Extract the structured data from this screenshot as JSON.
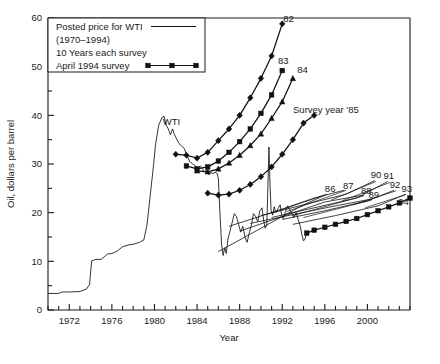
{
  "chart_data": {
    "type": "line",
    "title": "",
    "xlabel": "Year",
    "ylabel": "Oil, dollars per barrel",
    "xlim": [
      1970,
      2004
    ],
    "ylim": [
      0,
      60
    ],
    "xticks_major": [
      1972,
      1976,
      1980,
      1984,
      1988,
      1992,
      1996,
      2000
    ],
    "xtick_labels": [
      "1972",
      "1976",
      "1980",
      "1984",
      "1988",
      "1992",
      "1996",
      "2000"
    ],
    "xtick_minor_step": 1,
    "yticks_major": [
      0,
      10,
      20,
      30,
      40,
      50,
      60
    ],
    "ytick_labels": [
      "0",
      "10",
      "20",
      "30",
      "40",
      "50",
      "60"
    ],
    "ytick_minor": [
      5,
      15,
      25,
      35,
      45,
      55
    ],
    "grid": false,
    "legend_position": "top-left",
    "legend_entries": [
      {
        "label": "Posted price for WTI",
        "sample": "line"
      },
      {
        "label": "(1970–1994)",
        "sample": "none"
      },
      {
        "label": "10 Years each survey",
        "sample": "none"
      },
      {
        "label": "April 1994 survey",
        "sample": "line-square"
      }
    ],
    "annotations": [
      {
        "text": "WTI",
        "x": 1981.6,
        "y": 38.0
      },
      {
        "text": "82",
        "x": 1992.6,
        "y": 59.2
      },
      {
        "text": "83",
        "x": 1992.1,
        "y": 50.6
      },
      {
        "text": "84",
        "x": 1993.9,
        "y": 48.6
      },
      {
        "text": "Survey year '85",
        "x": 1996.1,
        "y": 40.4
      },
      {
        "text": "86",
        "x": 1996.5,
        "y": 24.2
      },
      {
        "text": "87",
        "x": 1998.2,
        "y": 24.9
      },
      {
        "text": "88",
        "x": 1999.9,
        "y": 23.9
      },
      {
        "text": "89",
        "x": 2000.6,
        "y": 23.0
      },
      {
        "text": "90",
        "x": 2000.8,
        "y": 27.2
      },
      {
        "text": "91",
        "x": 2002.0,
        "y": 27.0
      },
      {
        "text": "92",
        "x": 2002.6,
        "y": 25.1
      },
      {
        "text": "93",
        "x": 2003.7,
        "y": 24.3
      },
      {
        "text": "94",
        "x": 2003.4,
        "y": 21.6
      }
    ],
    "series": [
      {
        "name": "Posted price for WTI",
        "marker": "none",
        "kind": "wti",
        "points": [
          [
            1970.0,
            3.4
          ],
          [
            1971.0,
            3.4
          ],
          [
            1971.3,
            3.7
          ],
          [
            1972.0,
            3.7
          ],
          [
            1973.0,
            3.8
          ],
          [
            1973.6,
            4.3
          ],
          [
            1973.9,
            5.2
          ],
          [
            1974.1,
            10.1
          ],
          [
            1974.5,
            10.4
          ],
          [
            1975.0,
            10.4
          ],
          [
            1975.6,
            11.5
          ],
          [
            1976.0,
            11.6
          ],
          [
            1976.5,
            12.1
          ],
          [
            1977.0,
            13.0
          ],
          [
            1977.6,
            13.4
          ],
          [
            1978.0,
            13.5
          ],
          [
            1978.6,
            13.9
          ],
          [
            1979.0,
            14.4
          ],
          [
            1979.3,
            17.5
          ],
          [
            1979.6,
            23.5
          ],
          [
            1979.9,
            29.5
          ],
          [
            1980.1,
            34.0
          ],
          [
            1980.4,
            38.0
          ],
          [
            1980.7,
            39.5
          ],
          [
            1980.9,
            39.8
          ],
          [
            1981.1,
            38.0
          ],
          [
            1981.3,
            37.2
          ],
          [
            1981.5,
            36.0
          ],
          [
            1981.7,
            37.2
          ],
          [
            1981.85,
            36.2
          ],
          [
            1982.0,
            35.5
          ],
          [
            1982.3,
            34.2
          ],
          [
            1982.5,
            33.8
          ],
          [
            1982.8,
            33.2
          ],
          [
            1983.0,
            32.0
          ],
          [
            1983.3,
            30.5
          ],
          [
            1983.6,
            30.0
          ],
          [
            1983.9,
            29.5
          ],
          [
            1984.1,
            29.2
          ],
          [
            1984.3,
            29.6
          ],
          [
            1984.5,
            29.0
          ],
          [
            1984.7,
            28.4
          ],
          [
            1984.9,
            28.8
          ],
          [
            1985.1,
            27.8
          ],
          [
            1985.3,
            28.3
          ],
          [
            1985.5,
            28.0
          ],
          [
            1985.7,
            28.3
          ],
          [
            1985.9,
            28.0
          ],
          [
            1986.0,
            27.0
          ],
          [
            1986.15,
            20.0
          ],
          [
            1986.3,
            13.5
          ],
          [
            1986.45,
            11.2
          ],
          [
            1986.6,
            12.8
          ],
          [
            1986.75,
            11.6
          ],
          [
            1986.9,
            14.6
          ],
          [
            1987.1,
            16.2
          ],
          [
            1987.3,
            18.0
          ],
          [
            1987.5,
            19.8
          ],
          [
            1987.7,
            19.2
          ],
          [
            1987.9,
            17.6
          ],
          [
            1988.1,
            16.0
          ],
          [
            1988.3,
            17.2
          ],
          [
            1988.5,
            15.0
          ],
          [
            1988.7,
            13.9
          ],
          [
            1988.9,
            15.8
          ],
          [
            1989.1,
            17.4
          ],
          [
            1989.3,
            19.8
          ],
          [
            1989.5,
            19.2
          ],
          [
            1989.7,
            18.2
          ],
          [
            1989.9,
            20.4
          ],
          [
            1990.1,
            21.0
          ],
          [
            1990.25,
            18.5
          ],
          [
            1990.4,
            16.8
          ],
          [
            1990.55,
            17.5
          ],
          [
            1990.65,
            25.0
          ],
          [
            1990.75,
            33.5
          ],
          [
            1990.85,
            26.0
          ],
          [
            1990.95,
            20.5
          ],
          [
            1991.1,
            19.5
          ],
          [
            1991.25,
            21.2
          ],
          [
            1991.4,
            20.0
          ],
          [
            1991.6,
            20.8
          ],
          [
            1991.8,
            21.6
          ],
          [
            1991.95,
            19.4
          ],
          [
            1992.1,
            18.8
          ],
          [
            1992.3,
            20.2
          ],
          [
            1992.5,
            21.4
          ],
          [
            1992.7,
            20.6
          ],
          [
            1992.9,
            19.8
          ],
          [
            1993.1,
            19.0
          ],
          [
            1993.3,
            20.0
          ],
          [
            1993.5,
            18.6
          ],
          [
            1993.7,
            17.2
          ],
          [
            1993.85,
            15.4
          ],
          [
            1994.0,
            14.2
          ],
          [
            1994.15,
            14.6
          ],
          [
            1994.3,
            16.0
          ],
          [
            1994.45,
            16.2
          ]
        ]
      },
      {
        "name": "Survey 82",
        "marker": "diamond",
        "kind": "survey",
        "points": [
          [
            1982.0,
            32.0
          ],
          [
            1983.0,
            31.8
          ],
          [
            1984.0,
            31.2
          ],
          [
            1985.0,
            32.4
          ],
          [
            1986.0,
            34.8
          ],
          [
            1987.0,
            37.2
          ],
          [
            1988.0,
            40.0
          ],
          [
            1989.0,
            43.6
          ],
          [
            1990.0,
            47.6
          ],
          [
            1991.0,
            52.2
          ],
          [
            1992.0,
            58.8
          ]
        ]
      },
      {
        "name": "Survey 83",
        "marker": "square",
        "kind": "survey",
        "points": [
          [
            1983.0,
            29.6
          ],
          [
            1984.0,
            29.0
          ],
          [
            1985.0,
            29.4
          ],
          [
            1986.0,
            30.6
          ],
          [
            1987.0,
            32.4
          ],
          [
            1988.0,
            34.6
          ],
          [
            1989.0,
            37.2
          ],
          [
            1990.0,
            40.4
          ],
          [
            1991.0,
            44.2
          ],
          [
            1992.0,
            49.2
          ]
        ]
      },
      {
        "name": "Survey 84",
        "marker": "triangle",
        "kind": "survey",
        "points": [
          [
            1984.0,
            28.6
          ],
          [
            1985.0,
            28.4
          ],
          [
            1986.0,
            29.0
          ],
          [
            1987.0,
            30.2
          ],
          [
            1988.0,
            31.8
          ],
          [
            1989.0,
            33.8
          ],
          [
            1990.0,
            36.2
          ],
          [
            1991.0,
            39.4
          ],
          [
            1992.0,
            42.8
          ],
          [
            1993.0,
            47.6
          ]
        ]
      },
      {
        "name": "Survey year '85",
        "marker": "diamond",
        "kind": "survey",
        "points": [
          [
            1985.0,
            24.0
          ],
          [
            1986.0,
            23.6
          ],
          [
            1987.0,
            23.8
          ],
          [
            1988.0,
            24.6
          ],
          [
            1989.0,
            25.8
          ],
          [
            1990.0,
            27.4
          ],
          [
            1991.0,
            29.4
          ],
          [
            1992.0,
            32.0
          ],
          [
            1993.0,
            35.0
          ],
          [
            1994.0,
            38.4
          ],
          [
            1995.0,
            40.0
          ]
        ]
      },
      {
        "name": "Survey 86",
        "marker": "none",
        "kind": "thin",
        "points": [
          [
            1986.0,
            12.0
          ],
          [
            1990.0,
            16.8
          ],
          [
            1994.0,
            21.6
          ],
          [
            1996.0,
            23.6
          ]
        ]
      },
      {
        "name": "Survey 87",
        "marker": "none",
        "kind": "thin",
        "points": [
          [
            1987.0,
            17.2
          ],
          [
            1991.0,
            20.0
          ],
          [
            1995.0,
            23.0
          ],
          [
            1997.8,
            24.6
          ]
        ]
      },
      {
        "name": "Survey 88",
        "marker": "none",
        "kind": "thin",
        "points": [
          [
            1988.0,
            16.2
          ],
          [
            1992.0,
            19.2
          ],
          [
            1996.0,
            22.2
          ],
          [
            1999.6,
            23.6
          ]
        ]
      },
      {
        "name": "Survey 89",
        "marker": "none",
        "kind": "thin",
        "points": [
          [
            1989.0,
            17.8
          ],
          [
            1993.0,
            19.6
          ],
          [
            1997.0,
            21.4
          ],
          [
            2000.4,
            22.8
          ]
        ]
      },
      {
        "name": "Survey 90",
        "marker": "none",
        "kind": "thin",
        "points": [
          [
            1990.0,
            19.4
          ],
          [
            1994.0,
            21.6
          ],
          [
            1998.0,
            23.8
          ],
          [
            2000.7,
            26.6
          ]
        ]
      },
      {
        "name": "Survey 91",
        "marker": "none",
        "kind": "thin",
        "points": [
          [
            1991.0,
            19.0
          ],
          [
            1995.0,
            21.0
          ],
          [
            1999.0,
            23.0
          ],
          [
            2001.9,
            26.4
          ]
        ]
      },
      {
        "name": "Survey 92",
        "marker": "none",
        "kind": "thin",
        "points": [
          [
            1992.0,
            18.6
          ],
          [
            1996.0,
            20.4
          ],
          [
            2000.0,
            22.4
          ],
          [
            2002.5,
            24.6
          ]
        ]
      },
      {
        "name": "Survey 93",
        "marker": "none",
        "kind": "thin",
        "points": [
          [
            1993.0,
            17.6
          ],
          [
            1997.0,
            19.4
          ],
          [
            2001.0,
            21.4
          ],
          [
            2003.6,
            23.8
          ]
        ]
      },
      {
        "name": "April 1994 survey",
        "marker": "square",
        "kind": "survey",
        "points": [
          [
            1994.3,
            15.8
          ],
          [
            1995.0,
            16.4
          ],
          [
            1996.0,
            17.0
          ],
          [
            1997.0,
            17.6
          ],
          [
            1998.0,
            18.2
          ],
          [
            1999.0,
            18.8
          ],
          [
            2000.0,
            19.6
          ],
          [
            2001.0,
            20.4
          ],
          [
            2002.0,
            21.2
          ],
          [
            2003.0,
            22.0
          ],
          [
            2004.0,
            23.0
          ]
        ]
      }
    ]
  }
}
